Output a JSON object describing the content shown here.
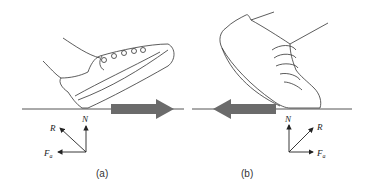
{
  "panels": [
    {
      "id": "a",
      "caption": "(a)",
      "motion_arrow_direction": "right",
      "forces": {
        "normal": "N",
        "resultant": "R",
        "friction": "F",
        "friction_subscript": "a"
      }
    },
    {
      "id": "b",
      "caption": "(b)",
      "motion_arrow_direction": "left",
      "forces": {
        "normal": "N",
        "resultant": "R",
        "friction": "F",
        "friction_subscript": "a"
      }
    }
  ],
  "colors": {
    "ground_line": "#555555",
    "motion_arrow": "#6b6b6b",
    "outline": "#333333"
  }
}
